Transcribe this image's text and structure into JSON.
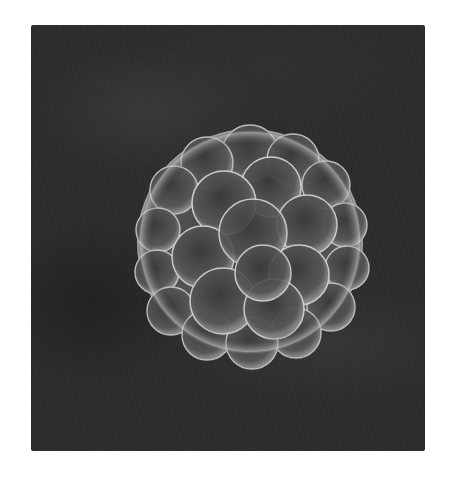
{
  "image": {
    "subject": "embryo-cell-cluster",
    "background_color": "#2b2b2b",
    "cell_color": "#9a9a9a",
    "highlight_color": "#d8d8d8"
  }
}
